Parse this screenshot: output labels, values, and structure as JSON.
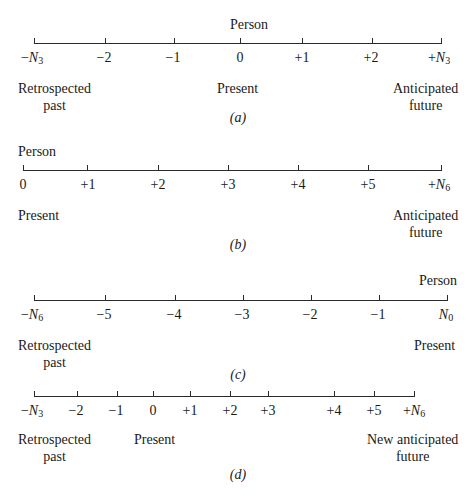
{
  "panels": [
    {
      "caption": "(a)",
      "person_label": "Person",
      "ticks": [
        "−N3",
        "−2",
        "−1",
        "0",
        "+1",
        "+2",
        "+N3"
      ],
      "left_label": [
        "Retrospected",
        "past"
      ],
      "middle_label": "Present",
      "right_label": [
        "Anticipated",
        "future"
      ]
    },
    {
      "caption": "(b)",
      "person_label": "Person",
      "ticks": [
        "0",
        "+1",
        "+2",
        "+3",
        "+4",
        "+5",
        "+N6"
      ],
      "left_label": [
        "Present"
      ],
      "right_label": [
        "Anticipated",
        "future"
      ]
    },
    {
      "caption": "(c)",
      "person_label": "Person",
      "ticks": [
        "−N6",
        "−5",
        "−4",
        "−3",
        "−2",
        "−1",
        "N0"
      ],
      "left_label": [
        "Retrospected",
        "past"
      ],
      "right_label": [
        "Present"
      ]
    },
    {
      "caption": "(d)",
      "ticks": [
        "−N3",
        "−2",
        "−1",
        "0",
        "+1",
        "+2",
        "+3",
        "+4",
        "+5",
        "+N6"
      ],
      "left_label": [
        "Retrospected",
        "past"
      ],
      "middle_label": "Present",
      "right_label": [
        "New anticipated",
        "future"
      ]
    }
  ]
}
